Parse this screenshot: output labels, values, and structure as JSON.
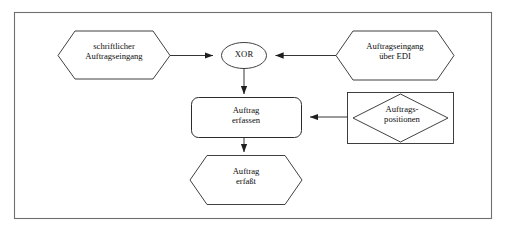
{
  "diagram": {
    "type": "epc-process-chain",
    "language": "de",
    "frame": {
      "name": "outer-frame",
      "stroke": "#5a5a5a"
    },
    "colors": {
      "stroke": "#2b2b2b",
      "frame_stroke": "#6b6b6b",
      "text": "#0d0d0d",
      "background": "#ffffff"
    },
    "nodes": [
      {
        "id": "event-written-order",
        "shape": "hexagon",
        "role": "event",
        "label": "schriftlicher\nAuftragseingang"
      },
      {
        "id": "connector-xor",
        "shape": "ellipse",
        "role": "connector",
        "label": "XOR"
      },
      {
        "id": "event-edi-order",
        "shape": "hexagon",
        "role": "event",
        "label": "Auftragseingang\nüber EDI"
      },
      {
        "id": "function-capture-order",
        "shape": "rounded-rectangle",
        "role": "function",
        "label": "Auftrag\nerfassen"
      },
      {
        "id": "data-order-positions",
        "shape": "diamond-in-rectangle",
        "role": "data-object",
        "label": "Auftrags-\npositionen"
      },
      {
        "id": "event-order-captured",
        "shape": "hexagon",
        "role": "event",
        "label": "Auftrag\nerfaßt"
      }
    ],
    "edges": [
      {
        "id": "edge-written-to-xor",
        "from": "event-written-order",
        "to": "connector-xor",
        "direction": "right",
        "arrow": true
      },
      {
        "id": "edge-edi-to-xor",
        "from": "event-edi-order",
        "to": "connector-xor",
        "direction": "left",
        "arrow": true
      },
      {
        "id": "edge-xor-to-function",
        "from": "connector-xor",
        "to": "function-capture-order",
        "direction": "down",
        "arrow": true
      },
      {
        "id": "edge-data-to-function",
        "from": "data-order-positions",
        "to": "function-capture-order",
        "direction": "left",
        "arrow": true
      },
      {
        "id": "edge-function-to-event",
        "from": "function-capture-order",
        "to": "event-order-captured",
        "direction": "down",
        "arrow": true
      }
    ]
  }
}
